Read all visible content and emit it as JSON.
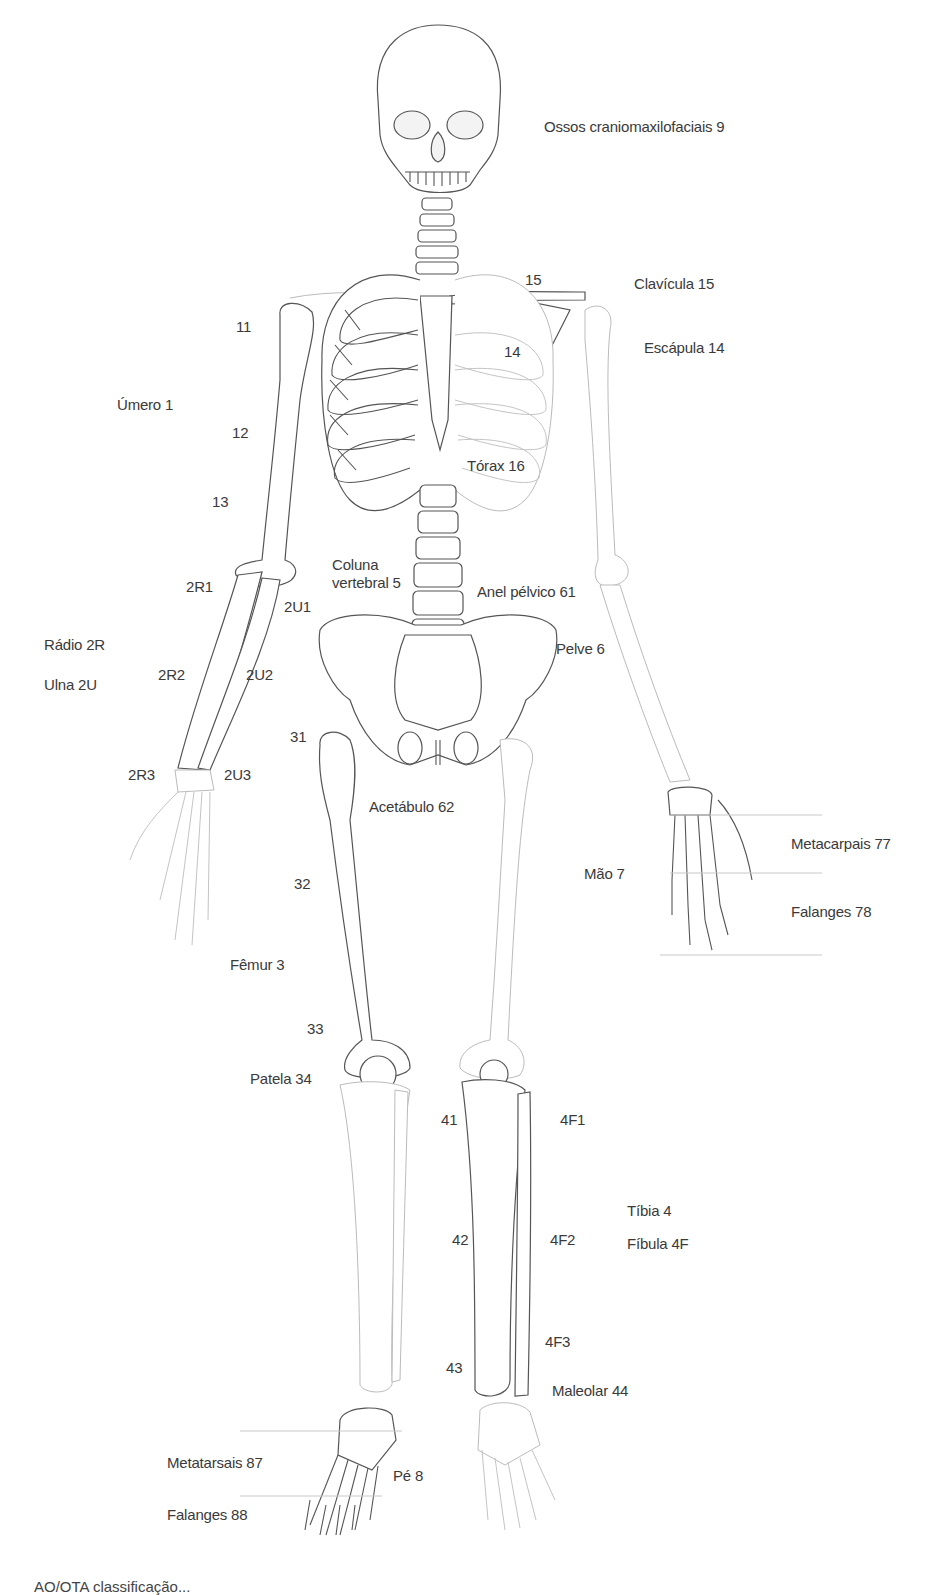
{
  "figure": {
    "caption": "AO/OTA classificação..."
  },
  "labels": {
    "cranio": "Ossos craniomaxilofaciais 9",
    "clavicula_num": "15",
    "clavicula": "Clavícula 15",
    "escapula_num": "14",
    "escapula": "Escápula 14",
    "umero_11": "11",
    "umero_12": "12",
    "umero_13": "13",
    "umero": "Úmero 1",
    "torax": "Tórax 16",
    "coluna": "Coluna vertebral 5",
    "anel_pelvico": "Anel pélvico 61",
    "pelve": "Pelve 6",
    "r1": "2R1",
    "u1": "2U1",
    "r2": "2R2",
    "u2": "2U2",
    "r3": "2R3",
    "u3": "2U3",
    "radio": "Rádio 2R",
    "ulna": "Ulna 2U",
    "femur_31": "31",
    "femur_32": "32",
    "femur_33": "33",
    "acetabulo": "Acetábulo 62",
    "femur": "Fêmur 3",
    "patela": "Patela 34",
    "mao": "Mão 7",
    "metacarpais": "Metacarpais 77",
    "falanges_mao": "Falanges 78",
    "tibia_41": "41",
    "tibia_42": "42",
    "tibia_43": "43",
    "fibula_4f1": "4F1",
    "fibula_4f2": "4F2",
    "fibula_4f3": "4F3",
    "tibia": "Tíbia 4",
    "fibula": "Fíbula 4F",
    "maleolar": "Maleolar 44",
    "metatarsais": "Metatarsais 87",
    "pe": "Pé 8",
    "falanges_pe": "Falanges 88"
  }
}
